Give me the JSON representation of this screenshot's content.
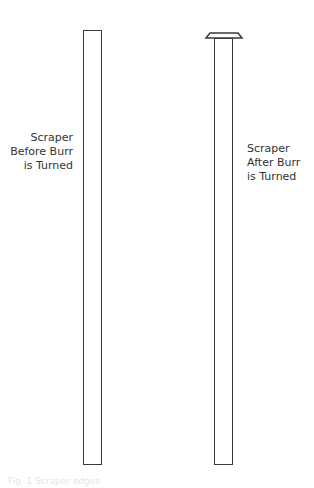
{
  "figure": {
    "left": {
      "label_lines": [
        "Scraper",
        "Before Burr",
        "is Turned"
      ]
    },
    "right": {
      "label_lines": [
        "Scraper",
        "After Burr",
        "is Turned"
      ]
    },
    "caption": "Fig. 1   Scraper edges"
  }
}
